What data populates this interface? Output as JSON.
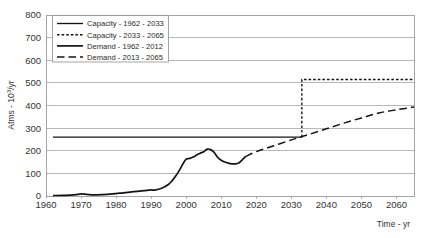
{
  "chart_data": {
    "type": "line",
    "title": "",
    "xlabel": "Time - yr",
    "ylabel": "Atms - 10³/yr",
    "xlim": [
      1960,
      2065
    ],
    "ylim": [
      0,
      800
    ],
    "grid": true,
    "legend_position": "top-left-inside",
    "x_ticks": [
      1960,
      1970,
      1980,
      1990,
      2000,
      2010,
      2020,
      2030,
      2040,
      2050,
      2060
    ],
    "y_ticks": [
      0,
      100,
      200,
      300,
      400,
      500,
      600,
      700,
      800
    ],
    "series": [
      {
        "name": "Capacity - 1962 - 2033",
        "style": "solid-thin",
        "x": [
          1962,
          2033
        ],
        "values": [
          260,
          260
        ]
      },
      {
        "name": "Capacity - 2033 - 2065",
        "style": "short-dash",
        "x": [
          2033,
          2033,
          2065
        ],
        "values": [
          260,
          515,
          515
        ]
      },
      {
        "name": "Demand - 1962 - 2012",
        "style": "solid-thick",
        "x": [
          1962,
          1965,
          1968,
          1970,
          1971,
          1973,
          1976,
          1979,
          1982,
          1985,
          1988,
          1990,
          1991,
          1993,
          1995,
          1996,
          1997,
          1998,
          1999,
          2000,
          2001,
          2002,
          2003,
          2004,
          2005,
          2006,
          2007,
          2008,
          2009,
          2010,
          2011,
          2012,
          2013,
          2014,
          2015,
          2016,
          2017
        ],
        "values": [
          2,
          3,
          5,
          9,
          8,
          5,
          6,
          9,
          14,
          19,
          24,
          27,
          26,
          34,
          52,
          68,
          88,
          112,
          140,
          163,
          166,
          172,
          181,
          189,
          196,
          207,
          205,
          192,
          170,
          158,
          150,
          145,
          142,
          142,
          146,
          160,
          175
        ]
      },
      {
        "name": "Demand - 2013 - 2065",
        "style": "long-dash",
        "x": [
          2017,
          2020,
          2025,
          2030,
          2033,
          2035,
          2040,
          2045,
          2050,
          2055,
          2060,
          2065
        ],
        "values": [
          175,
          196,
          222,
          248,
          262,
          272,
          297,
          322,
          345,
          367,
          381,
          393
        ]
      }
    ]
  },
  "legend": {
    "items": [
      {
        "label": "Capacity - 1962 - 2033",
        "style": "solid-thin"
      },
      {
        "label": "Capacity - 2033 - 2065",
        "style": "short-dash"
      },
      {
        "label": "Demand - 1962 - 2012",
        "style": "solid-thick"
      },
      {
        "label": "Demand - 2013 - 2065",
        "style": "long-dash"
      }
    ]
  },
  "axes": {
    "y_title": "Atms - 10³/yr",
    "y_title_main": "Atms - 10",
    "y_title_sup": "3",
    "y_title_tail": "/yr",
    "x_title": "Time - yr",
    "y_tick_labels": [
      "800",
      "700",
      "600",
      "500",
      "400",
      "300",
      "200",
      "100",
      "0"
    ],
    "x_tick_labels": [
      "1960",
      "1970",
      "1980",
      "1990",
      "2000",
      "2010",
      "2020",
      "2030",
      "2040",
      "2050",
      "2060"
    ]
  }
}
